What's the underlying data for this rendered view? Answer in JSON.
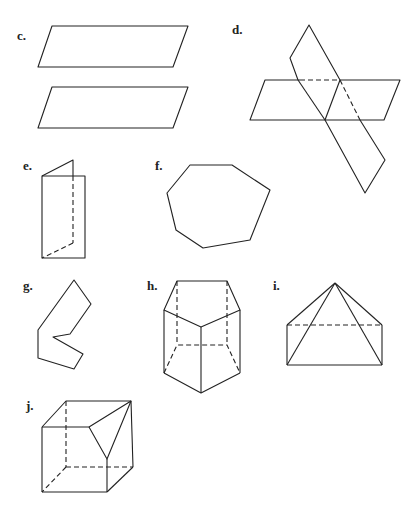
{
  "figures": [
    {
      "id": "c",
      "label": "c.",
      "description": "two parallel planes"
    },
    {
      "id": "d",
      "label": "d.",
      "description": "two intersecting planes"
    },
    {
      "id": "e",
      "label": "e.",
      "description": "folded plane / dihedral angle"
    },
    {
      "id": "f",
      "label": "f.",
      "description": "heptagon"
    },
    {
      "id": "g",
      "label": "g.",
      "description": "concave polygon"
    },
    {
      "id": "h",
      "label": "h.",
      "description": "pentagonal prism"
    },
    {
      "id": "i",
      "label": "i.",
      "description": "pyramid on prism"
    },
    {
      "id": "j",
      "label": "j.",
      "description": "cube with cut corner"
    }
  ]
}
